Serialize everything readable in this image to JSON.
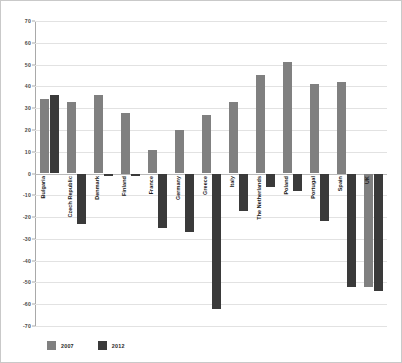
{
  "chart_data": {
    "type": "bar",
    "title": "",
    "subtitle": "",
    "xlabel": "",
    "ylabel": "",
    "ylim": [
      -70,
      70
    ],
    "yticks": [
      70,
      60,
      50,
      40,
      30,
      20,
      10,
      0,
      -10,
      -20,
      -30,
      -40,
      -50,
      -60,
      -70
    ],
    "ytick_labels": [
      "70",
      "60",
      "50",
      "40",
      "30",
      "20",
      "10",
      "0",
      "-10",
      "-20",
      "-30",
      "-40",
      "-50",
      "-60",
      "-70"
    ],
    "grid": true,
    "legend_position": "bottom-left",
    "categories": [
      "Bulgaria",
      "Czech Republic",
      "Denmark",
      "Finland",
      "France",
      "Germany",
      "Greece",
      "Italy",
      "The Netherlands",
      "Poland",
      "Portugal",
      "Spain",
      "UK"
    ],
    "series": [
      {
        "name": "2007",
        "color": "#808080",
        "values": [
          34,
          33,
          36,
          28,
          11,
          20,
          27,
          33,
          45,
          51,
          41,
          42,
          -52
        ]
      },
      {
        "name": "2012",
        "color": "#3a3a3a",
        "values": [
          36,
          -23,
          -1,
          -1,
          -25,
          -27,
          -62,
          -17,
          -6,
          -8,
          -22,
          -52,
          -54
        ]
      }
    ]
  },
  "legend": {
    "items": [
      {
        "label": "2007",
        "swatch": "legend-swatch-2007"
      },
      {
        "label": "2012",
        "swatch": "legend-swatch-2012"
      }
    ]
  }
}
